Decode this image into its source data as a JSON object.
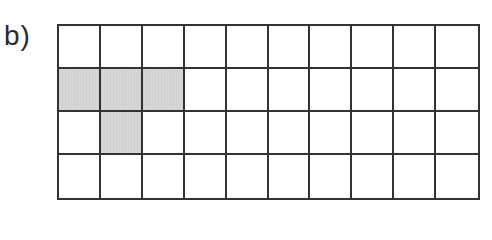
{
  "label": "b)",
  "grid": {
    "rows": 4,
    "cols": 10,
    "shaded_cells": [
      {
        "row": 1,
        "col": 0
      },
      {
        "row": 1,
        "col": 1
      },
      {
        "row": 1,
        "col": 2
      },
      {
        "row": 2,
        "col": 1
      }
    ],
    "shaded_count": 4,
    "total_cells": 40
  },
  "colors": {
    "line": "#333333",
    "shade": "#d4d4d4",
    "background": "#ffffff"
  }
}
